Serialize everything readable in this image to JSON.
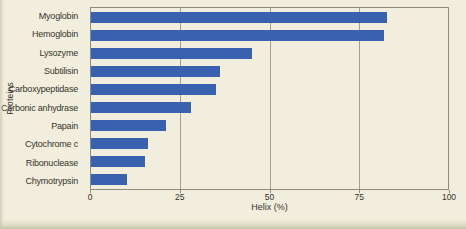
{
  "colors": {
    "background": "#f2eedd",
    "bar": "#3a61b0",
    "plot_border": "#8b8c7e",
    "gridline": "#9fa091",
    "text": "#35342b",
    "scan_edge": "#c6c7a9"
  },
  "chart_data": {
    "type": "bar",
    "orientation": "horizontal",
    "title": "",
    "xlabel": "Helix (%)",
    "ylabel": "Proteins",
    "xlim": [
      0,
      100
    ],
    "xticks": [
      0,
      25,
      50,
      75,
      100
    ],
    "grid": "vertical gridlines at interior ticks (25, 50, 75), drawn behind bars",
    "legend": "none",
    "categories": [
      "Myoglobin",
      "Hemoglobin",
      "Lysozyme",
      "Subtilisin",
      "Carboxypeptidase",
      "Carbonic anhydrase",
      "Papain",
      "Cytochrome c",
      "Ribonuclease",
      "Chymotrypsin"
    ],
    "values": [
      83,
      82,
      45,
      36,
      35,
      28,
      21,
      16,
      15,
      10
    ]
  }
}
